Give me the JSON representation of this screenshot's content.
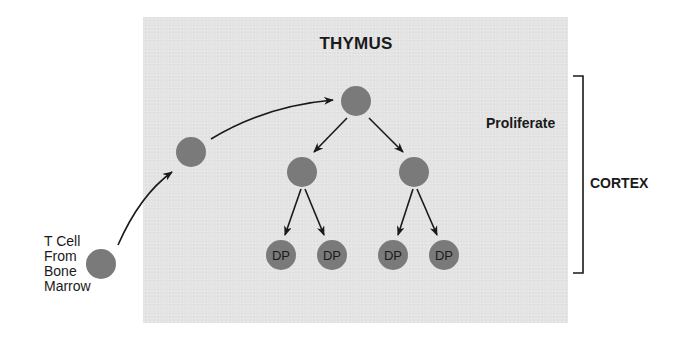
{
  "diagram": {
    "title": "THYMUS",
    "source_label": {
      "lines": [
        "T Cell",
        "From",
        "Bone",
        "Marrow"
      ]
    },
    "annotations": {
      "proliferate": "Proliferate",
      "region": "CORTEX"
    },
    "nodes": [
      {
        "id": "bone-marrow-cell",
        "label": "",
        "x": 101,
        "y": 264
      },
      {
        "id": "migrating-cell",
        "label": "",
        "x": 191,
        "y": 152
      },
      {
        "id": "thymus-entry-cell",
        "label": "",
        "x": 356,
        "y": 101
      },
      {
        "id": "daughter-left",
        "label": "",
        "x": 302,
        "y": 172
      },
      {
        "id": "daughter-right",
        "label": "",
        "x": 414,
        "y": 172
      },
      {
        "id": "dp-1",
        "label": "DP",
        "x": 281,
        "y": 255
      },
      {
        "id": "dp-2",
        "label": "DP",
        "x": 332,
        "y": 255
      },
      {
        "id": "dp-3",
        "label": "DP",
        "x": 393,
        "y": 255
      },
      {
        "id": "dp-4",
        "label": "DP",
        "x": 444,
        "y": 255
      }
    ],
    "edges": [
      {
        "from": "bone-marrow-cell",
        "to": "migrating-cell",
        "curved": true
      },
      {
        "from": "migrating-cell",
        "to": "thymus-entry-cell",
        "curved": true
      },
      {
        "from": "thymus-entry-cell",
        "to": "daughter-left"
      },
      {
        "from": "thymus-entry-cell",
        "to": "daughter-right"
      },
      {
        "from": "daughter-left",
        "to": "dp-1"
      },
      {
        "from": "daughter-left",
        "to": "dp-2"
      },
      {
        "from": "daughter-right",
        "to": "dp-3"
      },
      {
        "from": "daughter-right",
        "to": "dp-4"
      }
    ],
    "colors": {
      "panel": "#e4e4e4",
      "cell": "#7a7a7a",
      "arrow": "#1a1a1a",
      "text": "#1a1a1a"
    }
  }
}
